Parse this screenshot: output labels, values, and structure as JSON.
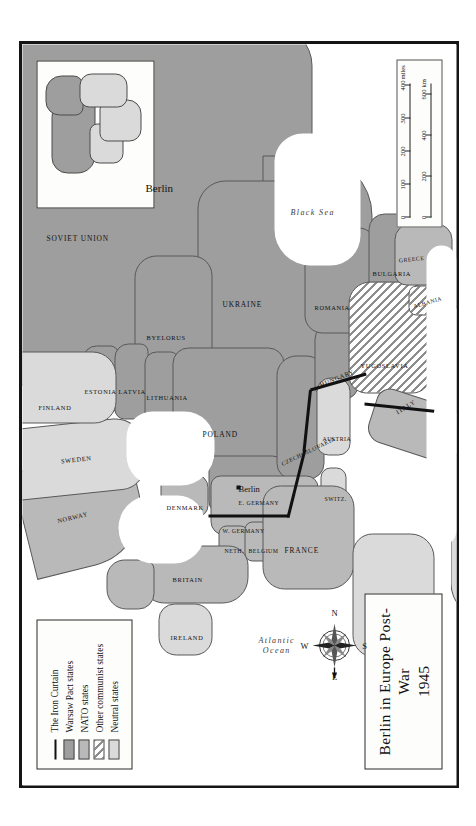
{
  "map": {
    "title_main": "Berlin in Europe Post-War",
    "title_year": "1945",
    "inset_label": "Berlin",
    "ocean_labels": [
      {
        "name": "atlantic",
        "text": "Atlantic\nOcean"
      },
      {
        "name": "black-sea",
        "text": "Black Sea"
      }
    ],
    "city": {
      "name": "Berlin",
      "label": "Berlin"
    }
  },
  "legend": {
    "items": [
      {
        "key": "line",
        "label": "The Iron Curtain",
        "color": "#111111"
      },
      {
        "key": "swatch",
        "label": "Warsaw Pact states",
        "color": "#9e9e9e"
      },
      {
        "key": "swatch",
        "label": "NATO states",
        "color": "#b9b9b9"
      },
      {
        "key": "hatch",
        "label": "Other communist states",
        "color": "#8d8d8d"
      },
      {
        "key": "swatch",
        "label": "Neutral states",
        "color": "#dadada"
      }
    ]
  },
  "compass": {
    "north": "N",
    "east": "E",
    "south": "S",
    "west": "W"
  },
  "scale": {
    "miles_ticks": [
      "0",
      "100",
      "200",
      "300",
      "400"
    ],
    "miles_unit": "miles",
    "km_ticks": [
      "0",
      "200",
      "400",
      "600"
    ],
    "km_unit": "km"
  },
  "countries": [
    {
      "name": "soviet-union",
      "label": "SOVIET UNION",
      "tone": "warsaw"
    },
    {
      "name": "byelorus",
      "label": "BYELORUS",
      "tone": "warsaw"
    },
    {
      "name": "ukraine",
      "label": "UKRAINE",
      "tone": "warsaw"
    },
    {
      "name": "estonia",
      "label": "ESTONIA",
      "tone": "warsaw"
    },
    {
      "name": "latvia",
      "label": "LATVIA",
      "tone": "warsaw"
    },
    {
      "name": "lithuania",
      "label": "LITHUANIA",
      "tone": "warsaw"
    },
    {
      "name": "poland",
      "label": "POLAND",
      "tone": "warsaw"
    },
    {
      "name": "east-germany",
      "label": "E. GERMANY",
      "tone": "warsaw"
    },
    {
      "name": "czechoslovakia",
      "label": "CZECHOSLOVAKIA",
      "tone": "warsaw"
    },
    {
      "name": "hungary",
      "label": "HUNGARY",
      "tone": "warsaw"
    },
    {
      "name": "romania",
      "label": "ROMANIA",
      "tone": "warsaw"
    },
    {
      "name": "bulgaria",
      "label": "BULGARIA",
      "tone": "warsaw"
    },
    {
      "name": "yugoslavia",
      "label": "YUGOSLAVIA",
      "tone": "communist"
    },
    {
      "name": "albania",
      "label": "ALBANIA",
      "tone": "communist"
    },
    {
      "name": "greece",
      "label": "GREECE",
      "tone": "nato"
    },
    {
      "name": "italy",
      "label": "ITALY",
      "tone": "nato"
    },
    {
      "name": "austria",
      "label": "AUSTRIA",
      "tone": "neutral"
    },
    {
      "name": "switzerland",
      "label": "SWITZ.",
      "tone": "neutral"
    },
    {
      "name": "west-germany",
      "label": "W. GERMANY",
      "tone": "nato"
    },
    {
      "name": "netherlands",
      "label": "NETH.",
      "tone": "nato"
    },
    {
      "name": "belgium",
      "label": "BELGIUM",
      "tone": "nato"
    },
    {
      "name": "france",
      "label": "FRANCE",
      "tone": "nato"
    },
    {
      "name": "britain",
      "label": "BRITAIN",
      "tone": "nato"
    },
    {
      "name": "ireland",
      "label": "IRELAND",
      "tone": "neutral"
    },
    {
      "name": "denmark",
      "label": "DENMARK",
      "tone": "nato"
    },
    {
      "name": "norway",
      "label": "NORWAY",
      "tone": "nato"
    },
    {
      "name": "sweden",
      "label": "SWEDEN",
      "tone": "neutral"
    },
    {
      "name": "finland",
      "label": "FINLAND",
      "tone": "neutral"
    },
    {
      "name": "spain",
      "label": "SPAIN",
      "tone": "neutral"
    },
    {
      "name": "portugal",
      "label": "PORTUGAL",
      "tone": "nato"
    }
  ]
}
